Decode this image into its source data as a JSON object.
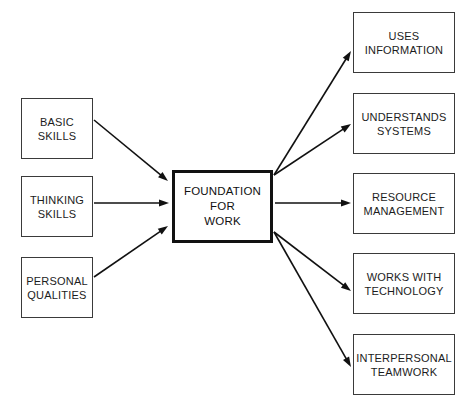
{
  "diagram": {
    "title": "Foundation For Work",
    "type": "flow-diagram",
    "background_color": "#ffffff",
    "box_border_color": "#3a3a3a",
    "center_box_border_color": "#111111",
    "arrow_color": "#111111",
    "text_color": "#1c1c1c"
  },
  "center": {
    "label": "FOUNDATION\nFOR\nWORK",
    "x": 172,
    "y": 170,
    "width": 101,
    "height": 73
  },
  "inputs": [
    {
      "label": "BASIC\nSKILLS",
      "x": 21,
      "y": 98,
      "width": 72,
      "height": 61
    },
    {
      "label": "THINKING\nSKILLS",
      "x": 21,
      "y": 176,
      "width": 72,
      "height": 61
    },
    {
      "label": "PERSONAL\nQUALITIES",
      "x": 21,
      "y": 257,
      "width": 72,
      "height": 61
    }
  ],
  "outputs": [
    {
      "label": "USES\nINFORMATION",
      "x": 353,
      "y": 12,
      "width": 102,
      "height": 61
    },
    {
      "label": "UNDERSTANDS\nSYSTEMS",
      "x": 353,
      "y": 93,
      "width": 102,
      "height": 61
    },
    {
      "label": "RESOURCE\nMANAGEMENT",
      "x": 353,
      "y": 173,
      "width": 102,
      "height": 61
    },
    {
      "label": "WORKS WITH\nTECHNOLOGY",
      "x": 353,
      "y": 253,
      "width": 102,
      "height": 61
    },
    {
      "label": "INTERPERSONAL\nTEAMWORK",
      "x": 353,
      "y": 334,
      "width": 102,
      "height": 61
    }
  ],
  "connectors": [
    {
      "from": "BASIC SKILLS",
      "to": "FOUNDATION FOR WORK",
      "x1": 94,
      "y1": 120,
      "x2": 168,
      "y2": 181
    },
    {
      "from": "THINKING SKILLS",
      "to": "FOUNDATION FOR WORK",
      "x1": 94,
      "y1": 203,
      "x2": 169,
      "y2": 203
    },
    {
      "from": "PERSONAL QUALITIES",
      "to": "FOUNDATION FOR WORK",
      "x1": 94,
      "y1": 277,
      "x2": 168,
      "y2": 226
    },
    {
      "from": "FOUNDATION FOR WORK",
      "to": "USES INFORMATION",
      "x1": 274,
      "y1": 175,
      "x2": 351,
      "y2": 51
    },
    {
      "from": "FOUNDATION FOR WORK",
      "to": "UNDERSTANDS SYSTEMS",
      "x1": 274,
      "y1": 175,
      "x2": 351,
      "y2": 124
    },
    {
      "from": "FOUNDATION FOR WORK",
      "to": "RESOURCE MANAGEMENT",
      "x1": 275,
      "y1": 203,
      "x2": 351,
      "y2": 203
    },
    {
      "from": "FOUNDATION FOR WORK",
      "to": "WORKS WITH TECHNOLOGY",
      "x1": 274,
      "y1": 232,
      "x2": 351,
      "y2": 291
    },
    {
      "from": "FOUNDATION FOR WORK",
      "to": "INTERPERSONAL TEAMWORK",
      "x1": 274,
      "y1": 232,
      "x2": 351,
      "y2": 367
    }
  ]
}
